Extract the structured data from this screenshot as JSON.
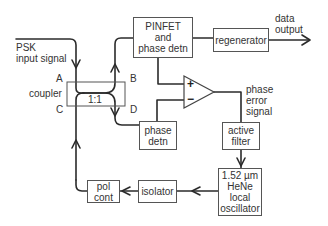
{
  "diagram": {
    "type": "block-diagram",
    "inputs": {
      "psk_input": "PSK\ninput signal"
    },
    "outputs": {
      "data_output": "data\noutput"
    },
    "blocks": {
      "pinfet": {
        "lines": [
          "PINFET",
          "and",
          "phase detn"
        ]
      },
      "regenerator": {
        "lines": [
          "regenerator"
        ]
      },
      "coupler": {
        "ratio": "1:1",
        "label": "coupler",
        "ports": [
          "A",
          "B",
          "C",
          "D"
        ]
      },
      "phase_detn": {
        "lines": [
          "phase",
          "detn"
        ]
      },
      "active_filter": {
        "lines": [
          "active",
          "filter"
        ]
      },
      "local_oscillator": {
        "lines": [
          "1.52 µm",
          "HeNe",
          "local",
          "oscillator"
        ]
      },
      "isolator": {
        "lines": [
          "isolator"
        ]
      },
      "pol_cont": {
        "lines": [
          "pol",
          "cont"
        ]
      }
    },
    "amplifier": {
      "plus": "+",
      "minus": "−",
      "output_label": [
        "phase",
        "error",
        "signal"
      ]
    },
    "connections": [
      [
        "PSK input",
        "coupler A"
      ],
      [
        "coupler B",
        "PINFET and phase detn"
      ],
      [
        "coupler D",
        "phase detn"
      ],
      [
        "PINFET and phase detn",
        "regenerator"
      ],
      [
        "regenerator",
        "data output"
      ],
      [
        "PINFET and phase detn",
        "amplifier +"
      ],
      [
        "phase detn",
        "amplifier −"
      ],
      [
        "amplifier",
        "active filter"
      ],
      [
        "active filter",
        "1.52 µm HeNe local oscillator"
      ],
      [
        "1.52 µm HeNe local oscillator",
        "isolator"
      ],
      [
        "isolator",
        "pol cont"
      ],
      [
        "pol cont",
        "coupler C"
      ]
    ]
  }
}
